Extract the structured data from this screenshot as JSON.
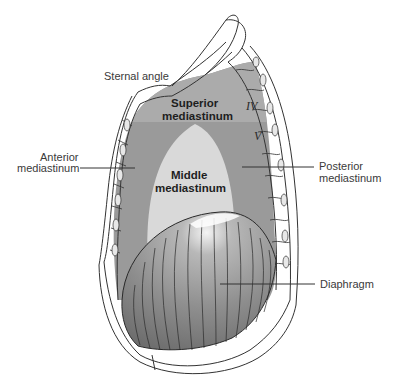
{
  "figure": {
    "type": "anatomical-diagram",
    "colors": {
      "background": "#ffffff",
      "superior_mediastinum": "#a9a9a9",
      "anterior_posterior_mediastinum": "#9a9a9a",
      "middle_mediastinum": "#d9d9d9",
      "diaphragm": "#8c8c8c",
      "bone_outline": "#333333"
    }
  },
  "labels": {
    "sternal_angle": "Sternal angle",
    "superior_line1": "Superior",
    "superior_line2": "mediastinum",
    "anterior_line1": "Anterior",
    "anterior_line2": "mediastinum",
    "middle_line1": "Middle",
    "middle_line2": "mediastinum",
    "posterior_line1": "Posterior",
    "posterior_line2": "mediastinum",
    "diaphragm": "Diaphragm",
    "vertebra_iv": "IV",
    "vertebra_v": "V"
  }
}
